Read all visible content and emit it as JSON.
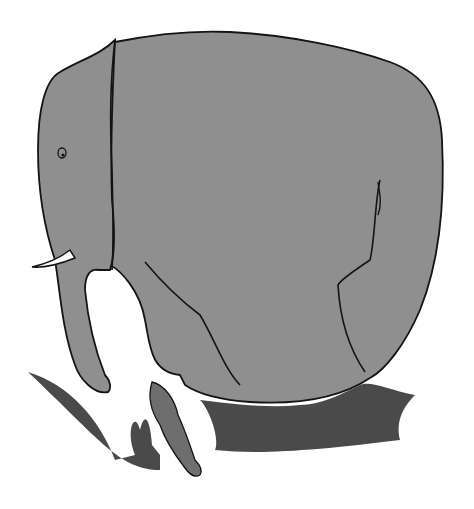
{
  "scene": {
    "title": "Elephant and rabbit in grass",
    "subjects": [
      "elephant",
      "rabbit",
      "grass"
    ],
    "colors": {
      "background": "#ffffff",
      "elephant_fill": "#8f8f8f",
      "outline": "#141414",
      "tusk": "#ffffff",
      "grass_dark": "#3a3a3a",
      "grass_mid": "#6a6a6a",
      "rabbit_fill": "#6e6e6e"
    }
  }
}
